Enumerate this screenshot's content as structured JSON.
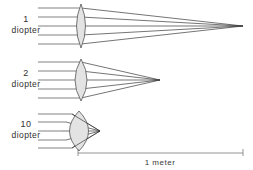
{
  "figure": {
    "background_color": "#ffffff",
    "ray_color": "#4a4a4a",
    "lens_fill_color": "#e3e3e3",
    "lens_stroke_color": "#555555",
    "text_color": "#2f2f2f",
    "scale_color": "#7a7a7a"
  },
  "rows": [
    {
      "id": "row-1-diopter",
      "power_number": "1",
      "unit_label": "diopter",
      "axis_y": 26,
      "ray_count": 5,
      "ray_start_x": 38,
      "lens_center_x": 81,
      "lens_half_height": 22,
      "lens_half_width": 9,
      "focus_x": 243,
      "focal_length_m": 1.0
    },
    {
      "id": "row-2-diopter",
      "power_number": "2",
      "unit_label": "diopter",
      "axis_y": 80,
      "ray_count": 5,
      "ray_start_x": 38,
      "lens_center_x": 81,
      "lens_half_height": 21,
      "lens_half_width": 12,
      "focus_x": 160,
      "focal_length_m": 0.5
    },
    {
      "id": "row-10-diopter",
      "power_number": "10",
      "unit_label": "diopter",
      "axis_y": 131,
      "ray_count": 5,
      "ray_start_x": 38,
      "lens_center_x": 79,
      "lens_half_height": 20,
      "lens_half_width": 17,
      "focus_x": 100,
      "focal_length_m": 0.1
    }
  ],
  "scale_bar": {
    "label": "1 meter",
    "left_x": 78,
    "right_x": 243,
    "y": 153,
    "tick_height": 5
  }
}
